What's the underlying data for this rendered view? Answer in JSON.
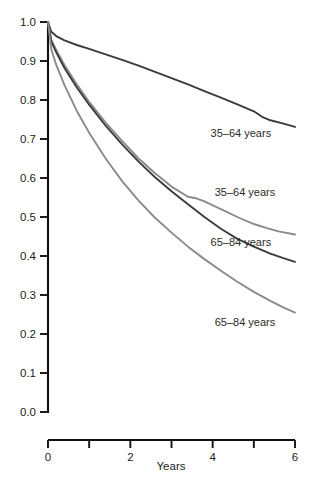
{
  "chart_data": {
    "type": "line",
    "title": "",
    "subtitle": "",
    "xlabel": "Years",
    "ylabel": "",
    "xlim": [
      0,
      6
    ],
    "ylim": [
      0,
      1
    ],
    "grid": false,
    "legend_position": "inline-right-of-curve",
    "x_ticks": [
      0,
      1,
      2,
      3,
      4,
      5,
      6
    ],
    "x_tick_labels": [
      "0",
      "",
      "2",
      "",
      "4",
      "",
      "6"
    ],
    "y_ticks": [
      0.0,
      0.1,
      0.2,
      0.3,
      0.4,
      0.5,
      0.6,
      0.7,
      0.8,
      0.9,
      1.0
    ],
    "y_tick_labels": [
      "0.0",
      "0.1",
      "0.2",
      "0.3",
      "0.4",
      "0.5",
      "0.6",
      "0.7",
      "0.8",
      "0.9",
      "1.0"
    ],
    "colors": {
      "dark": "#3b3b40",
      "gray": "#8a8a8f"
    },
    "series": [
      {
        "name": "35-64 years (upper)",
        "label": "35–64 years",
        "color": "#3b3b40",
        "label_x": 3.95,
        "label_y": 0.705,
        "x": [
          0,
          0.08,
          0.2,
          0.4,
          0.7,
          1.0,
          1.4,
          1.8,
          2.2,
          2.6,
          3.0,
          3.4,
          3.8,
          4.2,
          4.6,
          5.0,
          5.2,
          5.4,
          5.7,
          6.0
        ],
        "values": [
          1.0,
          0.975,
          0.964,
          0.953,
          0.941,
          0.931,
          0.917,
          0.903,
          0.888,
          0.872,
          0.856,
          0.84,
          0.823,
          0.806,
          0.789,
          0.771,
          0.757,
          0.748,
          0.74,
          0.731
        ]
      },
      {
        "name": "35-64 years (lower)",
        "label": "35–64 years",
        "color": "#8a8a8f",
        "label_x": 4.05,
        "label_y": 0.555,
        "x": [
          0,
          0.08,
          0.2,
          0.4,
          0.7,
          1.0,
          1.4,
          1.8,
          2.2,
          2.6,
          3.0,
          3.4,
          3.6,
          3.8,
          4.2,
          4.6,
          5.0,
          5.3,
          5.6,
          6.0
        ],
        "values": [
          1.0,
          0.955,
          0.928,
          0.89,
          0.84,
          0.795,
          0.742,
          0.695,
          0.65,
          0.612,
          0.578,
          0.552,
          0.548,
          0.54,
          0.52,
          0.5,
          0.482,
          0.472,
          0.463,
          0.455
        ]
      },
      {
        "name": "65-84 years (upper)",
        "label": "65–84 years",
        "color": "#3b3b40",
        "label_x": 3.95,
        "label_y": 0.425,
        "x": [
          0,
          0.08,
          0.2,
          0.4,
          0.7,
          1.0,
          1.4,
          1.8,
          2.2,
          2.6,
          3.0,
          3.4,
          3.8,
          4.2,
          4.6,
          5.0,
          5.4,
          5.7,
          6.0
        ],
        "values": [
          1.0,
          0.95,
          0.922,
          0.882,
          0.832,
          0.788,
          0.734,
          0.686,
          0.642,
          0.602,
          0.566,
          0.533,
          0.5,
          0.47,
          0.444,
          0.424,
          0.406,
          0.395,
          0.385
        ]
      },
      {
        "name": "65-84 years (lower)",
        "label": "65–84 years",
        "color": "#8a8a8f",
        "label_x": 4.05,
        "label_y": 0.22,
        "x": [
          0,
          0.08,
          0.2,
          0.4,
          0.7,
          1.0,
          1.4,
          1.8,
          2.2,
          2.6,
          3.0,
          3.4,
          3.8,
          4.2,
          4.6,
          5.0,
          5.4,
          5.7,
          6.0
        ],
        "values": [
          1.0,
          0.93,
          0.89,
          0.838,
          0.772,
          0.716,
          0.65,
          0.592,
          0.542,
          0.498,
          0.46,
          0.424,
          0.392,
          0.362,
          0.334,
          0.308,
          0.285,
          0.269,
          0.255
        ]
      }
    ]
  },
  "axis": {
    "x_title": "Years"
  },
  "caption": {
    "text": ""
  }
}
